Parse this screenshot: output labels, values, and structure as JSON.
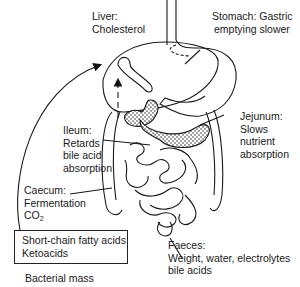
{
  "diagram": {
    "type": "anatomical-line-drawing",
    "labels": {
      "liver": {
        "title": "Liver:",
        "detail": "Cholesterol"
      },
      "stomach": {
        "title": "Stomach: Gastric",
        "detail": "emptying slower"
      },
      "jejunum": {
        "title": "Jejunum:",
        "lines": [
          "Slows",
          "nutrient",
          "absorption"
        ]
      },
      "ileum": {
        "title": "Ileum:",
        "lines": [
          "Retards",
          "bile acid",
          "absorption"
        ]
      },
      "caecum": {
        "title": "Caecum:",
        "lines": [
          "Fermentation"
        ],
        "gas": "CO",
        "gas_subscript": "2"
      },
      "products_box": {
        "lines": [
          "Short-chain fatty acids",
          "Ketoacids"
        ]
      },
      "bacterial_mass": "Bacterial mass",
      "faeces": {
        "title": "Faeces:",
        "lines": [
          "Weight, water, electrolytes",
          "bile acids"
        ]
      }
    },
    "arrows": [
      {
        "from": "products_box",
        "to": "liver",
        "style": "solid-curved"
      },
      {
        "from": "intestine",
        "to": "liver",
        "style": "dashed"
      }
    ]
  }
}
